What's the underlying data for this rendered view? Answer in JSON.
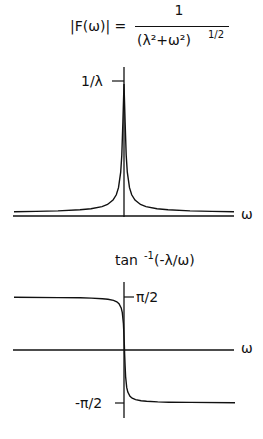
{
  "chart_data": [
    {
      "type": "line",
      "title": "|F(ω)| = 1 / (λ² + ω²)^(1/2)",
      "title_parts": {
        "lhs": "|F(ω)| =",
        "numerator": "1",
        "denominator": "(λ²+ω²)",
        "exponent": "1/2"
      },
      "xlabel": "ω",
      "ylabel": "",
      "y_ticks": [
        {
          "label": "1/λ",
          "value": 1
        }
      ],
      "xlim": [
        -10,
        10
      ],
      "ylim": [
        0,
        1.1
      ],
      "lambda": 0.1,
      "function": "1/(lambda*sqrt(lambda^2+w^2)) normalized so peak = 1/lambda",
      "x": [
        -10,
        -8,
        -6,
        -4,
        -3,
        -2,
        -1.5,
        -1,
        -0.7,
        -0.5,
        -0.3,
        -0.2,
        -0.1,
        0,
        0.1,
        0.2,
        0.3,
        0.5,
        0.7,
        1,
        1.5,
        2,
        3,
        4,
        6,
        8,
        10
      ],
      "y": [
        0.01,
        0.0125,
        0.0166,
        0.025,
        0.033,
        0.05,
        0.066,
        0.1,
        0.141,
        0.196,
        0.316,
        0.447,
        0.707,
        1.0,
        0.707,
        0.447,
        0.316,
        0.196,
        0.141,
        0.1,
        0.066,
        0.05,
        0.033,
        0.025,
        0.0166,
        0.0125,
        0.01
      ],
      "grid": false,
      "legend": null
    },
    {
      "type": "line",
      "title": "tan⁻¹(-λ/ω)",
      "title_parts": {
        "base": "tan",
        "sup": "-1",
        "arg": "(-λ/ω)"
      },
      "xlabel": "ω",
      "ylabel": "",
      "y_ticks": [
        {
          "label": "π/2",
          "value": 1.5708
        },
        {
          "label": "-π/2",
          "value": -1.5708
        }
      ],
      "xlim": [
        -10,
        10
      ],
      "ylim": [
        -1.85,
        1.85
      ],
      "lambda": 0.1,
      "x": [
        -10,
        -6,
        -4,
        -3,
        -2,
        -1.5,
        -1,
        -0.7,
        -0.5,
        -0.3,
        -0.2,
        -0.1,
        -0.05,
        -0.01,
        0.01,
        0.05,
        0.1,
        0.2,
        0.3,
        0.5,
        0.7,
        1,
        1.5,
        2,
        3,
        4,
        6,
        10
      ],
      "y": [
        1.561,
        1.554,
        1.546,
        1.537,
        1.521,
        1.504,
        1.471,
        1.429,
        1.373,
        1.249,
        1.107,
        0.785,
        0.464,
        0.1,
        -0.1,
        -0.464,
        -0.785,
        -1.107,
        -1.249,
        -1.373,
        -1.429,
        -1.471,
        -1.504,
        -1.521,
        -1.537,
        -1.546,
        -1.554,
        -1.561
      ],
      "grid": false,
      "legend": null
    }
  ],
  "figure": {
    "top": {
      "lhs": "|F(ω)| =",
      "numerator": "1",
      "denominator": "(λ²+ω²)",
      "exponent": "1/2",
      "ytick": "1/λ",
      "xlabel": "ω"
    },
    "bottom": {
      "title_base": "tan",
      "title_sup": "-1",
      "title_arg": "(-λ/ω)",
      "ytick_top": "π/2",
      "ytick_bottom": "-π/2",
      "xlabel": "ω"
    },
    "colors": {
      "ink": "#111111",
      "background": "#ffffff"
    }
  }
}
